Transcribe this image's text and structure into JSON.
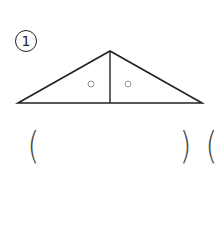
{
  "problem": {
    "number_label": "1"
  },
  "figure": {
    "type": "isosceles triangle split by altitude",
    "apex": [
      110,
      51
    ],
    "base_left": [
      18,
      103
    ],
    "base_right": [
      202,
      103
    ],
    "altitude_foot": [
      110,
      103
    ],
    "angle_marks": [
      "○",
      "○"
    ],
    "stroke_color": "#222222",
    "mark_color": "#888888"
  },
  "answer": {
    "open_paren": "(",
    "close_paren": ")",
    "next_open_paren": "("
  }
}
